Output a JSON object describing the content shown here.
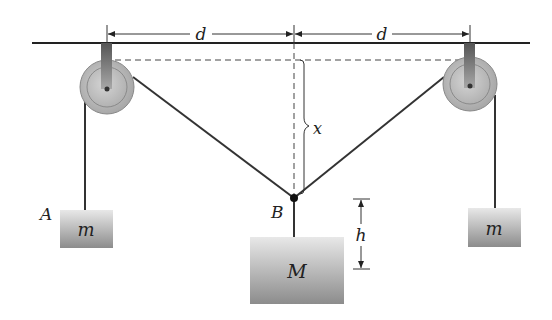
{
  "diagram": {
    "type": "pulley-system",
    "labels": {
      "distance_left": "d",
      "distance_right": "d",
      "vertical_displacement": "x",
      "height": "h",
      "point_left_mass": "A",
      "point_junction": "B",
      "left_mass": "m",
      "center_mass": "M",
      "right_mass": "m"
    },
    "colors": {
      "line": "#333333",
      "dashed": "#444444",
      "pulley_fill": "#b8b8b8",
      "pulley_inner": "#c8c8c8",
      "mass_top": "#e6e6e6",
      "mass_bottom": "#8e8e8e",
      "hanger_top": "#5a5a5a",
      "hanger_bottom": "#9a9a9a"
    }
  }
}
